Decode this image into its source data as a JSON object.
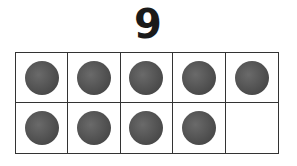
{
  "title": {
    "numeral": "9"
  },
  "ten_frame": {
    "rows": 2,
    "columns": 5,
    "filled_count": 9,
    "cells": [
      {
        "filled": true
      },
      {
        "filled": true
      },
      {
        "filled": true
      },
      {
        "filled": true
      },
      {
        "filled": true
      },
      {
        "filled": true
      },
      {
        "filled": true
      },
      {
        "filled": true
      },
      {
        "filled": true
      },
      {
        "filled": false
      }
    ],
    "counter_color": "#555555",
    "line_color": "#333333"
  }
}
